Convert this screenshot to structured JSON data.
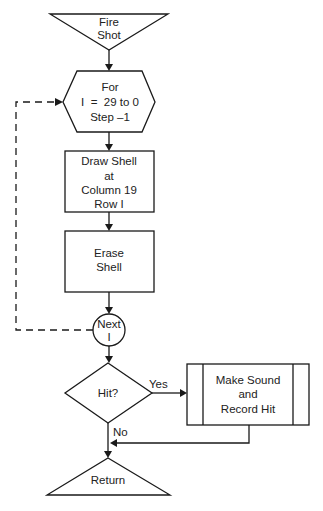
{
  "diagram": {
    "type": "flowchart",
    "colors": {
      "stroke": "#1a1a1a",
      "fill": "#ffffff",
      "text": "#222222"
    },
    "nodes": {
      "start": {
        "shape": "inverted-triangle",
        "lines": [
          "Fire",
          "Shot"
        ]
      },
      "loop": {
        "shape": "hexagon",
        "lines": [
          "For",
          "I  =  29 to 0",
          "Step –1"
        ]
      },
      "draw": {
        "shape": "rectangle",
        "lines": [
          "Draw Shell",
          "at",
          "Column 19",
          "Row I"
        ]
      },
      "erase": {
        "shape": "rectangle",
        "lines": [
          "Erase",
          "Shell"
        ]
      },
      "next": {
        "shape": "circle",
        "lines": [
          "Next",
          "I"
        ]
      },
      "decision": {
        "shape": "diamond",
        "lines": [
          "Hit?"
        ]
      },
      "process": {
        "shape": "predefined-process",
        "lines": [
          "Make Sound",
          "and",
          "Record Hit"
        ]
      },
      "end": {
        "shape": "triangle",
        "lines": [
          "Return"
        ]
      }
    },
    "edges": {
      "yes_label": "Yes",
      "no_label": "No"
    }
  }
}
